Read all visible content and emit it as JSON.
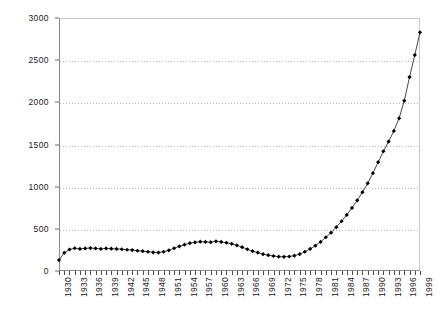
{
  "chart": {
    "title_sliver": "",
    "background_color": "#ffffff",
    "axis_color": "#8a8a8a",
    "grid_color": "#b9b9b9",
    "marker_color": "#000000",
    "line_color": "#1a1a1a"
  },
  "chart_data": {
    "type": "line",
    "title": "",
    "subtitle": "",
    "xlabel": "",
    "ylabel": "",
    "grid": true,
    "legend": "none",
    "marker": "diamond",
    "xlim": [
      1930,
      1999
    ],
    "ylim": [
      0,
      3000
    ],
    "yticks": [
      0,
      500,
      1000,
      1500,
      2000,
      2500,
      3000
    ],
    "ytick_labels": [
      "0",
      "500",
      "1000",
      "1500",
      "2000",
      "2500",
      "3000"
    ],
    "xtick_labels": [
      "1930",
      "1933",
      "1936",
      "1939",
      "1942",
      "1945",
      "1948",
      "1951",
      "1954",
      "1957",
      "1960",
      "1963",
      "1966",
      "1969",
      "1972",
      "1975",
      "1978",
      "1981",
      "1984",
      "1987",
      "1990",
      "1993",
      "1996",
      "1999"
    ],
    "xtick_interval_years": 3,
    "x": [
      1930,
      1931,
      1932,
      1933,
      1934,
      1935,
      1936,
      1937,
      1938,
      1939,
      1940,
      1941,
      1942,
      1943,
      1944,
      1945,
      1946,
      1947,
      1948,
      1949,
      1950,
      1951,
      1952,
      1953,
      1954,
      1955,
      1956,
      1957,
      1958,
      1959,
      1960,
      1961,
      1962,
      1963,
      1964,
      1965,
      1966,
      1967,
      1968,
      1969,
      1970,
      1971,
      1972,
      1973,
      1974,
      1975,
      1976,
      1977,
      1978,
      1979,
      1980,
      1981,
      1982,
      1983,
      1984,
      1985,
      1986,
      1987,
      1988,
      1989,
      1990,
      1991,
      1992,
      1993,
      1994,
      1995,
      1996,
      1997,
      1998,
      1999
    ],
    "values": [
      130,
      215,
      255,
      270,
      262,
      268,
      272,
      268,
      262,
      268,
      265,
      262,
      258,
      252,
      248,
      240,
      235,
      228,
      222,
      218,
      228,
      245,
      270,
      292,
      312,
      330,
      340,
      348,
      345,
      342,
      352,
      345,
      335,
      322,
      305,
      282,
      258,
      235,
      218,
      200,
      188,
      178,
      170,
      168,
      172,
      182,
      200,
      228,
      262,
      300,
      345,
      400,
      455,
      520,
      590,
      665,
      748,
      838,
      935,
      1040,
      1160,
      1290,
      1420,
      1535,
      1660,
      1810,
      2020,
      2300,
      2560,
      2830
    ]
  }
}
